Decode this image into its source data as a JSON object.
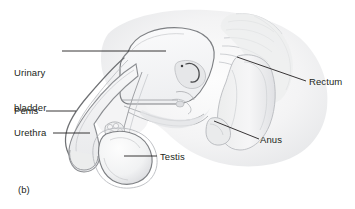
{
  "figure": {
    "caption": "(b)",
    "background_color": "#ffffff",
    "ink_color": "#231f20",
    "outline_color": "#6e7073",
    "tissue_light": "#f2f2f3",
    "tissue_mid": "#e2e3e5",
    "tissue_dark": "#c9cbce"
  },
  "labels": {
    "urinary_bladder": {
      "line1": "Urinary",
      "line2": "bladder"
    },
    "penis": "Penis",
    "urethra": "Urethra",
    "testis": "Testis",
    "rectum": "Rectum",
    "anus": "Anus"
  },
  "structures": [
    {
      "name": "urinary-bladder",
      "label": "Urinary bladder"
    },
    {
      "name": "penis",
      "label": "Penis"
    },
    {
      "name": "urethra",
      "label": "Urethra"
    },
    {
      "name": "testis",
      "label": "Testis"
    },
    {
      "name": "rectum",
      "label": "Rectum"
    },
    {
      "name": "anus",
      "label": "Anus"
    }
  ]
}
